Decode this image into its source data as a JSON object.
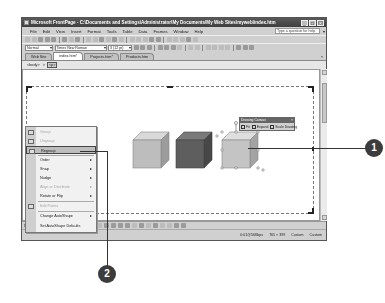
{
  "window": {
    "title": "Microsoft FrontPage - C:\\Documents and Settings\\Administrator\\My Documents\\My Web Sites\\myweb\\index.htm",
    "buttons": {
      "minimize": "_",
      "maximize": "□",
      "close": "×"
    }
  },
  "menubar": {
    "items": [
      "File",
      "Edit",
      "View",
      "Insert",
      "Format",
      "Tools",
      "Table",
      "Data",
      "Frames",
      "Window",
      "Help"
    ],
    "help_placeholder": "Type a question for help"
  },
  "formatting": {
    "style": "Normal",
    "font": "Times New Roman",
    "size": "3 (12 pt)"
  },
  "tabs": [
    {
      "label": "Web Site",
      "active": false
    },
    {
      "label": "index.htm*",
      "active": true
    },
    {
      "label": "Projects.htm*",
      "active": false
    },
    {
      "label": "Products.htm",
      "active": false
    }
  ],
  "tab_close": "×",
  "breadcrumb": [
    "<body>",
    ">",
    "<p>"
  ],
  "drawing_canvas_toolbar": {
    "title": "Drawing Canvas",
    "close": "×",
    "buttons": [
      "Fit",
      "Expand",
      "Scale Drawing"
    ]
  },
  "context_menu": {
    "items": [
      {
        "label": "Group",
        "disabled": true,
        "submenu": false
      },
      {
        "label": "Ungroup",
        "disabled": true,
        "submenu": false
      },
      {
        "label": "Regroup",
        "disabled": false,
        "submenu": false,
        "highlighted": true
      },
      {
        "label": "Order",
        "disabled": false,
        "submenu": true
      },
      {
        "label": "Snap",
        "disabled": false,
        "submenu": true
      },
      {
        "label": "Nudge",
        "disabled": false,
        "submenu": true
      },
      {
        "label": "Align or Distribute",
        "disabled": true,
        "submenu": true
      },
      {
        "label": "Rotate or Flip",
        "disabled": false,
        "submenu": true
      },
      {
        "label": "Edit Points",
        "disabled": true,
        "submenu": false
      },
      {
        "label": "Change AutoShape",
        "disabled": false,
        "submenu": true
      },
      {
        "label": "Set AutoShape Defaults",
        "disabled": false,
        "submenu": false
      }
    ],
    "submenu_arrow": "▸"
  },
  "drawing_toolbar": {
    "draw": "Draw ▾",
    "autoshapes": "AutoShapes ▾"
  },
  "statusbar": {
    "connection": "0:01@56Kbps",
    "dimensions": "765 × 399",
    "mode1": "Custom",
    "mode2": "Custom"
  },
  "cubes": [
    {
      "front": "#bdbdbd",
      "top": "#d9d9d9",
      "side": "#9c9c9c",
      "selected": false
    },
    {
      "front": "#5e5e5e",
      "top": "#7a7a7a",
      "side": "#474747",
      "selected": false
    },
    {
      "front": "#c4c4c4",
      "top": "#dedede",
      "side": "#a3a3a3",
      "selected": true
    }
  ],
  "callouts": [
    {
      "number": "1"
    },
    {
      "number": "2"
    }
  ]
}
